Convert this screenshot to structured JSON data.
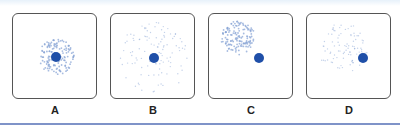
{
  "figure": {
    "panels": [
      {
        "label": "A",
        "dot": {
          "cx": 43,
          "cy": 43
        },
        "cloud": {
          "cx": 43,
          "cy": 43,
          "r": 18,
          "density": "dense",
          "n": 140
        }
      },
      {
        "label": "B",
        "dot": {
          "cx": 43,
          "cy": 44
        },
        "cloud": {
          "cx": 43,
          "cy": 44,
          "r": 36,
          "density": "sparse",
          "n": 110
        }
      },
      {
        "label": "C",
        "dot": {
          "cx": 50,
          "cy": 44
        },
        "cloud": {
          "cx": 29,
          "cy": 24,
          "r": 17,
          "density": "dense",
          "n": 140
        }
      },
      {
        "label": "D",
        "dot": {
          "cx": 56,
          "cy": 44
        },
        "cloud": {
          "cx": 36,
          "cy": 34,
          "r": 25,
          "density": "sparse",
          "n": 90
        }
      }
    ],
    "colors": {
      "dot": "#1f4fa8",
      "cloud": "#8aa6d6",
      "border": "#555555",
      "rule": "#7f93c8"
    }
  }
}
